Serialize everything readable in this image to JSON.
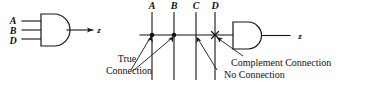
{
  "figure": {
    "width": 365,
    "height": 87,
    "background_color": "#ffffff",
    "ink_color": "#141414"
  },
  "left_gate": {
    "type": "AND",
    "name": "and-gate-conventional",
    "inputs": [
      {
        "label": "A"
      },
      {
        "label": "B"
      },
      {
        "label": "D"
      }
    ],
    "output_label": "z"
  },
  "right_gate": {
    "type": "AND",
    "name": "and-gate-pla",
    "output_label": "z"
  },
  "bus": {
    "columns": [
      {
        "label": "A",
        "x": 152,
        "junction": "true-connection"
      },
      {
        "label": "B",
        "x": 174,
        "junction": "true-connection"
      },
      {
        "label": "C",
        "x": 196,
        "junction": "no-connection"
      },
      {
        "label": "D",
        "x": 215,
        "junction": "complement-connection"
      }
    ]
  },
  "annotations": {
    "true_connection": {
      "line1": "True",
      "line2": "Connection"
    },
    "complement_connection": "Complement Connection",
    "no_connection": "No Connection"
  }
}
